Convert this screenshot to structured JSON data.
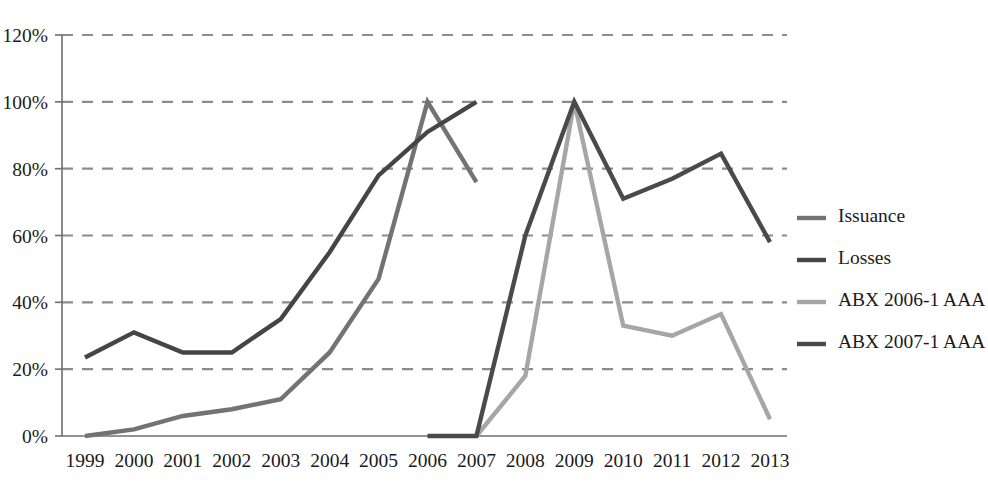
{
  "chart_data": {
    "type": "line",
    "title": "",
    "subtitle": "",
    "xlabel": "",
    "ylabel": "",
    "x": [
      1999,
      2000,
      2001,
      2002,
      2003,
      2004,
      2005,
      2006,
      2007,
      2008,
      2009,
      2010,
      2011,
      2012,
      2013
    ],
    "categories": [
      "1999",
      "2000",
      "2001",
      "2002",
      "2003",
      "2004",
      "2005",
      "2006",
      "2007",
      "2008",
      "2009",
      "2010",
      "2011",
      "2012",
      "2013"
    ],
    "ylim": [
      0,
      120
    ],
    "yticks": [
      0,
      20,
      40,
      60,
      80,
      100,
      120
    ],
    "ytick_labels": [
      "0%",
      "20%",
      "40%",
      "60%",
      "80%",
      "100%",
      "120%"
    ],
    "grid": true,
    "grid_axis": "y",
    "grid_style": "dashed",
    "legend_position": "right",
    "series": [
      {
        "name": "Issuance",
        "color": "#737373",
        "x": [
          1999,
          2000,
          2001,
          2002,
          2003,
          2004,
          2005,
          2006,
          2007
        ],
        "values": [
          0,
          2,
          6,
          8,
          11,
          25,
          47,
          100,
          76
        ]
      },
      {
        "name": "Losses",
        "color": "#454545",
        "x": [
          1999,
          2000,
          2001,
          2002,
          2003,
          2004,
          2005,
          2006,
          2007
        ],
        "values": [
          23.5,
          31,
          25,
          25,
          35,
          55,
          78,
          91,
          100
        ]
      },
      {
        "name": "ABX 2006-1 AAA",
        "color": "#a6a6a6",
        "x": [
          2007,
          2008,
          2009,
          2010,
          2011,
          2012,
          2013
        ],
        "values": [
          0,
          18,
          100,
          33,
          30,
          36.5,
          5
        ]
      },
      {
        "name": "ABX 2007-1 AAA",
        "color": "#4a4a4a",
        "x": [
          2006,
          2007,
          2008,
          2009,
          2010,
          2011,
          2012,
          2013
        ],
        "values": [
          0,
          0,
          60,
          100,
          71,
          77,
          84.5,
          58
        ]
      }
    ]
  },
  "axes": {
    "y_tick_labels": [
      "120%",
      "100%",
      "80%",
      "60%",
      "40%",
      "20%",
      "0%"
    ],
    "x_tick_labels": [
      "1999",
      "2000",
      "2001",
      "2002",
      "2003",
      "2004",
      "2005",
      "2006",
      "2007",
      "2008",
      "2009",
      "2010",
      "2011",
      "2012",
      "2013"
    ]
  },
  "legend": {
    "entries": [
      {
        "label": "Issuance",
        "color": "#737373"
      },
      {
        "label": "Losses",
        "color": "#454545"
      },
      {
        "label": "ABX 2006-1 AAA",
        "color": "#a6a6a6"
      },
      {
        "label": "ABX 2007-1 AAA",
        "color": "#4a4a4a"
      }
    ]
  },
  "style": {
    "background": "#ffffff",
    "grid_color": "#8c8c8c",
    "axis_color": "#6e6e6e",
    "text_color": "#1a1a1a"
  }
}
